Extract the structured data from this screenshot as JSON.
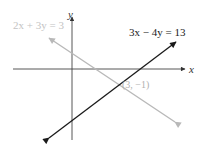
{
  "diagram": {
    "type": "coordinate-graph",
    "axes": {
      "x_label": "x",
      "y_label": "y"
    },
    "lines": [
      {
        "equation": "2x + 3y = 3",
        "color": "#b8b8b8",
        "label_color": "#c4c4c4"
      },
      {
        "equation": "3x − 4y = 13",
        "color": "#1a1a1a",
        "label_color": "#1a1a1a"
      }
    ],
    "intersection": {
      "label": "(3, −1)",
      "color": "#b0b0b0"
    }
  }
}
